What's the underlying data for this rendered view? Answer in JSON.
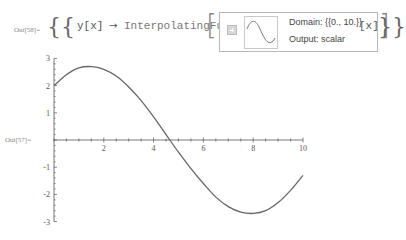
{
  "out58": {
    "label": "Out[58]=",
    "open_braces": "{{",
    "close_braces": "}}",
    "rule_lhs": "y[x]",
    "arrow": "→",
    "head": "InterpolatingFunction",
    "open_bracket": "[",
    "close_bracket": "]",
    "args": "[x]",
    "summary": {
      "expand_button": "plus-icon",
      "domain": "Domain: {{0., 10.}}",
      "output": "Output: scalar"
    }
  },
  "out57": {
    "label": "Out[57]="
  },
  "colors": {
    "curve": "#666666",
    "axis": "#555555",
    "summary_border": "#b8b8b8"
  },
  "chart_data": {
    "type": "line",
    "title": "",
    "xlabel": "",
    "ylabel": "",
    "xlim": [
      0,
      10
    ],
    "ylim": [
      -3,
      3
    ],
    "x_ticks": [
      "2",
      "4",
      "6",
      "8",
      "10"
    ],
    "y_ticks": [
      "3",
      "2",
      "1",
      "-1",
      "-2",
      "-3"
    ],
    "grid": false,
    "legend": null,
    "series": [
      {
        "name": "y[x]",
        "x": [
          0,
          0.5,
          1,
          1.5,
          2,
          2.5,
          3,
          3.5,
          4,
          4.5,
          5,
          5.5,
          6,
          6.5,
          7,
          7.5,
          8,
          8.5,
          9,
          9.5,
          10
        ],
        "values": [
          2.0,
          2.4,
          2.65,
          2.7,
          2.6,
          2.35,
          1.95,
          1.45,
          0.85,
          0.2,
          -0.45,
          -1.05,
          -1.6,
          -2.1,
          -2.45,
          -2.65,
          -2.7,
          -2.6,
          -2.3,
          -1.85,
          -1.3
        ]
      }
    ]
  }
}
